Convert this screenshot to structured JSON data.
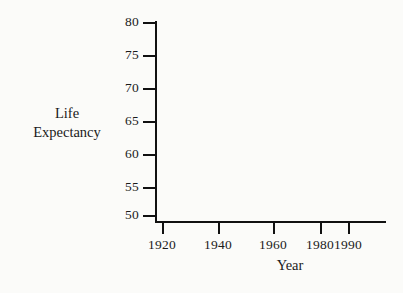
{
  "chart_data": {
    "type": "line",
    "title": "",
    "subtitle": "",
    "xlabel": "Year",
    "ylabel": "Life Expectancy",
    "ylabel_lines": [
      "Life",
      "Expectancy"
    ],
    "grid": false,
    "legend": null,
    "series": [],
    "x": [],
    "values": [],
    "note": "Empty axes template: no data points are plotted.",
    "xlim": [
      1913,
      2001
    ],
    "ylim": [
      48.5,
      80
    ],
    "xticks": [
      {
        "value": 1920,
        "label": "1920",
        "px": 162
      },
      {
        "value": 1940,
        "label": "1940",
        "px": 218
      },
      {
        "value": 1960,
        "label": "1960",
        "px": 273
      },
      {
        "value": 1980,
        "label": "1980",
        "px": 320
      },
      {
        "value": 1990,
        "label": "1990",
        "px": 348
      }
    ],
    "yticks": [
      {
        "value": 80,
        "label": "80",
        "px": 22
      },
      {
        "value": 75,
        "label": "75",
        "px": 55
      },
      {
        "value": 70,
        "label": "70",
        "px": 88
      },
      {
        "value": 65,
        "label": "65",
        "px": 121
      },
      {
        "value": 60,
        "label": "60",
        "px": 154
      },
      {
        "value": 55,
        "label": "55",
        "px": 187
      },
      {
        "value": 50,
        "label": "50",
        "px": 215
      }
    ]
  },
  "colors": {
    "background": "#fbfbf9",
    "axis": "#111111",
    "text": "#1a1a1a"
  }
}
